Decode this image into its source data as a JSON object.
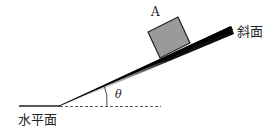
{
  "diagram": {
    "labels": {
      "block": "A",
      "incline": "斜面",
      "horizontal": "水平面",
      "angle": "θ"
    },
    "colors": {
      "block_fill": "#9a9a9a",
      "incline": "#000000",
      "line": "#222222"
    }
  }
}
